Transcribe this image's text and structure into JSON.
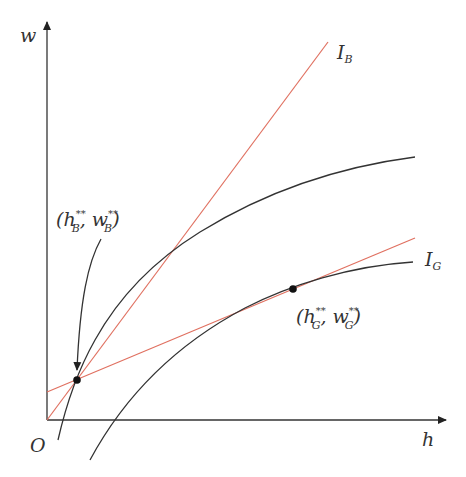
{
  "axes": {
    "x_label": "h",
    "y_label": "w",
    "origin_label": "O"
  },
  "lines": {
    "ib": {
      "label_main": "I",
      "label_sub": "B",
      "color": "#e07060"
    },
    "ig": {
      "label_main": "I",
      "label_sub": "G",
      "color": "#e07060"
    }
  },
  "points": {
    "b": {
      "open": "(h",
      "sub1": "B",
      "sup1": "**",
      "mid": ", w",
      "sub2": "B",
      "sup2": "**",
      "close": ")"
    },
    "g": {
      "open": "(h",
      "sub1": "G",
      "sup1": "**",
      "mid": ", w",
      "sub2": "G",
      "sup2": "**",
      "close": ")"
    }
  },
  "colors": {
    "curve": "#333333",
    "line": "#e07060",
    "axis": "#333333"
  }
}
